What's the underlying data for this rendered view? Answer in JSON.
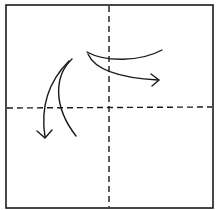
{
  "diagram": {
    "type": "origami-fold-diagram",
    "paper": {
      "shape": "square",
      "x": 6,
      "y": 5,
      "width": 207,
      "height": 203,
      "stroke": "#1a1a1a"
    },
    "fold_lines": [
      {
        "name": "vertical-center-valley-fold",
        "orientation": "vertical",
        "style": "dashed"
      },
      {
        "name": "horizontal-center-valley-fold",
        "orientation": "horizontal",
        "style": "dashed"
      }
    ],
    "arrows": [
      {
        "name": "fold-arrow-right",
        "direction": "down-right"
      },
      {
        "name": "fold-arrow-down",
        "direction": "down-left"
      }
    ],
    "colors": {
      "line": "#1a1a1a",
      "background": "#ffffff"
    }
  }
}
